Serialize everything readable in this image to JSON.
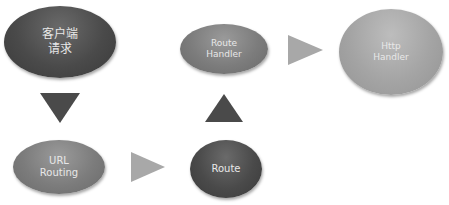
{
  "diagram": {
    "type": "flowchart",
    "nodes": [
      {
        "id": "client_request",
        "lines": [
          "客户端",
          "请求"
        ],
        "shade": "dark"
      },
      {
        "id": "url_routing",
        "lines": [
          "URL",
          "Routing"
        ],
        "shade": "mid"
      },
      {
        "id": "route",
        "lines": [
          "Route"
        ],
        "shade": "dark"
      },
      {
        "id": "route_handler",
        "lines": [
          "Route",
          "Handler"
        ],
        "shade": "mid"
      },
      {
        "id": "http_handler",
        "lines": [
          "Http",
          "Handler"
        ],
        "shade": "light"
      }
    ],
    "edges": [
      {
        "from": "client_request",
        "to": "url_routing",
        "direction": "down",
        "color": "#4a4a4a"
      },
      {
        "from": "url_routing",
        "to": "route",
        "direction": "right",
        "color": "#a8a8a8"
      },
      {
        "from": "route",
        "to": "route_handler",
        "direction": "up",
        "color": "#4a4a4a"
      },
      {
        "from": "route_handler",
        "to": "http_handler",
        "direction": "right",
        "color": "#a8a8a8"
      }
    ],
    "colors": {
      "dark": "#4a4a4a",
      "mid": "#7c7c7c",
      "light": "#a4a4a4",
      "text": "#e8e8e8"
    }
  }
}
